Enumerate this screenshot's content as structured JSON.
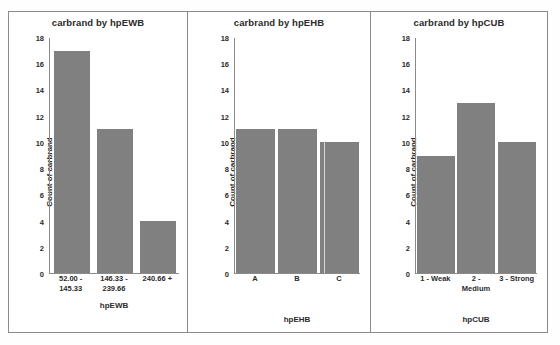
{
  "figure": {
    "panel_count": 3,
    "background_color": "#ffffff",
    "border_color": "#8a8a8a",
    "bar_color": "#808080"
  },
  "chart_data": [
    {
      "type": "bar",
      "title": "carbrand by hpEWB",
      "xlabel": "hpEWB",
      "ylabel": "Count of carbrand",
      "categories": [
        "52.00 - 145.33",
        "146.33 - 239.66",
        "240.66 +"
      ],
      "category_lines": [
        [
          "52.00 -",
          "145.33"
        ],
        [
          "146.33 -",
          "239.66"
        ],
        [
          "240.66 +"
        ]
      ],
      "values": [
        17,
        11,
        4
      ],
      "ylim": [
        0,
        18
      ],
      "yticks": [
        0,
        2,
        4,
        6,
        8,
        10,
        12,
        14,
        16,
        18
      ],
      "grid": false,
      "legend": null
    },
    {
      "type": "bar",
      "title": "carbrand by hpEHB",
      "xlabel": "hpEHB",
      "ylabel": "Count of carbrand",
      "categories": [
        "A",
        "B",
        "C"
      ],
      "category_lines": [
        [
          "A"
        ],
        [
          "B"
        ],
        [
          "C"
        ]
      ],
      "values": [
        11,
        11,
        10
      ],
      "ylim": [
        0,
        18
      ],
      "yticks": [
        0,
        2,
        4,
        6,
        8,
        10,
        12,
        14,
        16,
        18
      ],
      "grid": false,
      "legend": null
    },
    {
      "type": "bar",
      "title": "carbrand by hpCUB",
      "xlabel": "hpCUB",
      "ylabel": "Count of carbrand",
      "categories": [
        "1 - Weak",
        "2 - Medium",
        "3 - Strong"
      ],
      "category_lines": [
        [
          "1 - Weak"
        ],
        [
          "2 -",
          "Medium"
        ],
        [
          "3 - Strong"
        ]
      ],
      "values": [
        9,
        13,
        10
      ],
      "ylim": [
        0,
        18
      ],
      "yticks": [
        0,
        2,
        4,
        6,
        8,
        10,
        12,
        14,
        16,
        18
      ],
      "grid": false,
      "legend": null
    }
  ]
}
